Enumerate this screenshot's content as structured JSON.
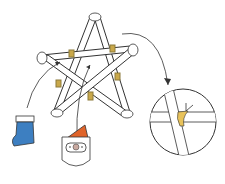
{
  "diagram": {
    "elements": [
      "paper-tube-star",
      "twine-ties",
      "stocking-ornament",
      "santa-ornament",
      "detail-magnifier",
      "arrows"
    ],
    "colors": {
      "outline": "#333333",
      "tube": "#ffffff",
      "twine": "#c9a84a",
      "ribbon": "#e8c25a",
      "stocking": "#3d7fc1",
      "santa_hat": "#e0642a",
      "santa_nose": "#c9a9a0"
    }
  }
}
